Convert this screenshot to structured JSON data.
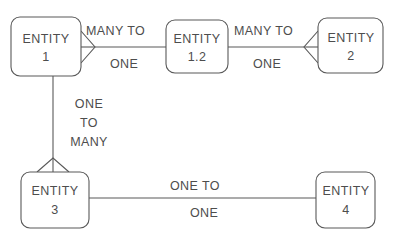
{
  "diagram": {
    "background_color": "#ffffff",
    "stroke_color": "#595959",
    "text_color": "#4d4d4d",
    "entities": [
      {
        "id": "entity-1",
        "line1": "ENTITY",
        "line2": "1",
        "x": 11,
        "y": 17,
        "w": 70,
        "h": 59
      },
      {
        "id": "entity-1-2",
        "line1": "ENTITY",
        "line2": "1.2",
        "x": 166,
        "y": 20,
        "w": 62,
        "h": 53
      },
      {
        "id": "entity-2",
        "line1": "ENTITY",
        "line2": "2",
        "x": 318,
        "y": 18,
        "w": 65,
        "h": 55
      },
      {
        "id": "entity-3",
        "line1": "ENTITY",
        "line2": "3",
        "x": 21,
        "y": 172,
        "w": 68,
        "h": 56
      },
      {
        "id": "entity-4",
        "line1": "ENTITY",
        "line2": "4",
        "x": 316,
        "y": 172,
        "w": 59,
        "h": 56
      }
    ],
    "relationships": [
      {
        "id": "rel-entity1-entity12",
        "from": "entity-1",
        "to": "entity-1.2",
        "above_label": "MANY  TO",
        "below_label": "ONE",
        "crow_foot_at": "entity-1"
      },
      {
        "id": "rel-entity12-entity2",
        "from": "entity-1.2",
        "to": "entity-2",
        "above_label": "MANY  TO",
        "below_label": "ONE",
        "crow_foot_at": "entity-2"
      },
      {
        "id": "rel-entity1-entity3",
        "from": "entity-1",
        "to": "entity-3",
        "stacked_label": [
          "ONE",
          "TO",
          "MANY"
        ],
        "crow_foot_at": "entity-3"
      },
      {
        "id": "rel-entity3-entity4",
        "from": "entity-3",
        "to": "entity-4",
        "above_label": "ONE  TO",
        "below_label": "ONE",
        "crow_foot_at": "none"
      }
    ]
  }
}
